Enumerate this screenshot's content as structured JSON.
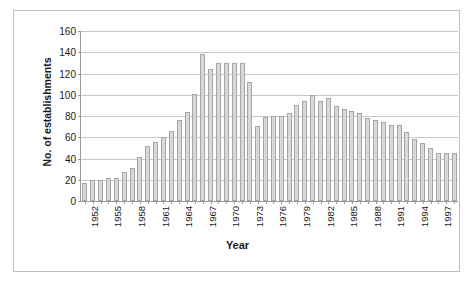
{
  "chart_data": {
    "type": "bar",
    "title": "",
    "xlabel": "Year",
    "ylabel": "No. of establishments",
    "ylim": [
      0,
      160
    ],
    "ytick_step": 20,
    "yticks": [
      0,
      20,
      40,
      60,
      80,
      100,
      120,
      140,
      160
    ],
    "grid": true,
    "legend": null,
    "xtick_labels": [
      "1952",
      "1955",
      "1958",
      "1961",
      "1964",
      "1967",
      "1970",
      "1973",
      "1976",
      "1979",
      "1982",
      "1985",
      "1988",
      "1991",
      "1994",
      "1997"
    ],
    "xtick_step_years": 3,
    "categories": [
      "1952",
      "1953",
      "1954",
      "1955",
      "1956",
      "1957",
      "1958",
      "1959",
      "1960",
      "1961",
      "1962",
      "1963",
      "1964",
      "1965",
      "1966",
      "1967",
      "1968",
      "1969",
      "1970",
      "1971",
      "1972",
      "1973",
      "1974",
      "1975",
      "1976",
      "1977",
      "1978",
      "1979",
      "1980",
      "1981",
      "1982",
      "1983",
      "1984",
      "1985",
      "1986",
      "1987",
      "1988",
      "1989",
      "1990",
      "1991",
      "1992",
      "1993",
      "1994",
      "1995",
      "1996",
      "1997",
      "1998",
      "1999"
    ],
    "values": [
      17,
      20,
      20,
      22,
      22,
      27,
      31,
      41,
      52,
      56,
      60,
      66,
      76,
      84,
      101,
      138,
      124,
      130,
      130,
      130,
      130,
      112,
      71,
      79,
      80,
      80,
      83,
      90,
      94,
      100,
      94,
      97,
      89,
      87,
      85,
      83,
      78,
      76,
      74,
      72,
      72,
      65,
      58,
      55,
      50,
      45,
      45,
      45
    ],
    "bar_color": "#d9d9d9",
    "bar_border_color": "#a6a6a6",
    "gridline_color": "#c8c8c8",
    "axis_color": "#9a9a9a",
    "frame_border_color": "#bfbfbf",
    "background_color": "#ffffff",
    "text_color": "#1a1a1a"
  }
}
